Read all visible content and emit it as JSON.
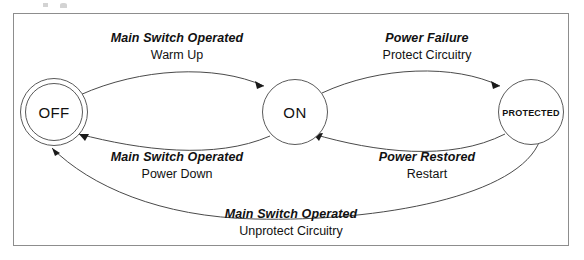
{
  "figure": {
    "type": "state-transition-diagram",
    "states": [
      {
        "id": "off",
        "label": "OFF",
        "shape": "double-circle"
      },
      {
        "id": "on",
        "label": "ON",
        "shape": "circle"
      },
      {
        "id": "protected",
        "label": "Protected",
        "shape": "circle"
      }
    ],
    "transitions": [
      {
        "id": "warm-up",
        "from": "OFF",
        "to": "ON",
        "event": "Main Switch Operated",
        "action": "Warm Up"
      },
      {
        "id": "protect-circuitry",
        "from": "ON",
        "to": "Protected",
        "event": "Power Failure",
        "action": "Protect Circuitry"
      },
      {
        "id": "power-down",
        "from": "ON",
        "to": "OFF",
        "event": "Main Switch Operated",
        "action": "Power Down"
      },
      {
        "id": "restart",
        "from": "Protected",
        "to": "ON",
        "event": "Power Restored",
        "action": "Restart"
      },
      {
        "id": "unprotect-circuitry",
        "from": "Protected",
        "to": "OFF",
        "event": "Main Switch Operated",
        "action": "Unprotect Circuitry"
      }
    ],
    "colors": {
      "frame_border": "#8d8d8d",
      "node_stroke": "#5a5a5a",
      "edge_stroke": "#4a4a4a",
      "arrowhead": "#1a1a1a",
      "text": "#111111",
      "background": "#ffffff"
    }
  }
}
